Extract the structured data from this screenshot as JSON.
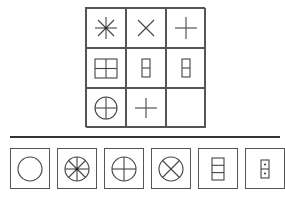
{
  "puzzle": {
    "grid": [
      {
        "row": 1,
        "col": 1,
        "figure": "asterisk-8-lines"
      },
      {
        "row": 1,
        "col": 2,
        "figure": "x-cross"
      },
      {
        "row": 1,
        "col": 3,
        "figure": "plus-cross"
      },
      {
        "row": 2,
        "col": 1,
        "figure": "square-4-panes"
      },
      {
        "row": 2,
        "col": 2,
        "figure": "rectangle-2-panes"
      },
      {
        "row": 2,
        "col": 3,
        "figure": "rectangle-2-panes"
      },
      {
        "row": 3,
        "col": 1,
        "figure": "circle-with-plus"
      },
      {
        "row": 3,
        "col": 2,
        "figure": "plus-cross"
      },
      {
        "row": 3,
        "col": 3,
        "figure": "empty"
      }
    ],
    "options": [
      {
        "index": 1,
        "figure": "circle"
      },
      {
        "index": 2,
        "figure": "circle-8-spokes-dot"
      },
      {
        "index": 3,
        "figure": "circle-with-plus"
      },
      {
        "index": 4,
        "figure": "circle-with-x"
      },
      {
        "index": 5,
        "figure": "rectangle-3-panes"
      },
      {
        "index": 6,
        "figure": "rectangle-2-panes-dots"
      }
    ]
  }
}
